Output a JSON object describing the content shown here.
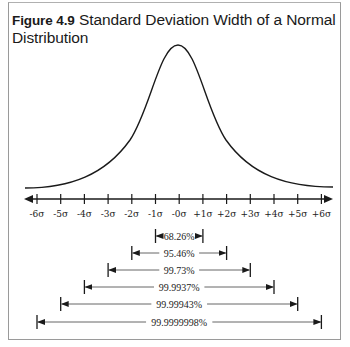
{
  "figure": {
    "number_label": "Figure 4.9",
    "title": "Standard Deviation Width of a Normal Distribution"
  },
  "chart_data": {
    "type": "line",
    "title": "Figure 4.9 Standard Deviation Width of a Normal Distribution",
    "xlabel": "",
    "ylabel": "",
    "axis_tick_labels": [
      "-6σ",
      "-5σ",
      "-4σ",
      "-3σ",
      "-2σ",
      "-1σ",
      "-0σ",
      "+1σ",
      "+2σ",
      "+3σ",
      "+4σ",
      "+5σ",
      "+6σ"
    ],
    "x": [
      -6,
      -5,
      -4,
      -3,
      -2,
      -1,
      0,
      1,
      2,
      3,
      4,
      5,
      6
    ],
    "curve": "bell-shaped normal distribution centered at 0",
    "grid": false,
    "ranges": [
      {
        "from": -1,
        "to": 1,
        "label": "68.26%"
      },
      {
        "from": -2,
        "to": 2,
        "label": "95.46%"
      },
      {
        "from": -3,
        "to": 3,
        "label": "99.73%"
      },
      {
        "from": -4,
        "to": 4,
        "label": "99.9937%"
      },
      {
        "from": -5,
        "to": 5,
        "label": "99.99943%"
      },
      {
        "from": -6,
        "to": 6,
        "label": "99.9999998%"
      }
    ]
  },
  "colors": {
    "ink": "#1a1a1a",
    "frame": "#9a9a9a",
    "arrow_line": "#555555"
  }
}
